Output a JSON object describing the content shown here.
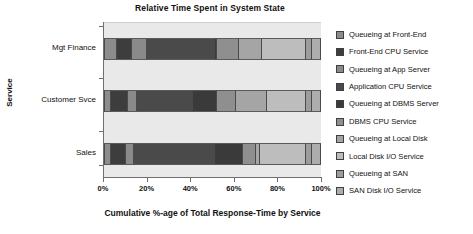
{
  "chart_data": {
    "type": "bar",
    "orientation": "horizontal",
    "stacked": true,
    "normalized": true,
    "title": "Relative Time Spent in System State",
    "xlabel": "Cumulative %-age of Total Response-Time by Service",
    "ylabel": "Service",
    "categories": [
      "Mgt Finance",
      "Customer Svce",
      "Sales"
    ],
    "category_order_top_to_bottom": [
      "Mgt Finance",
      "Customer Svce",
      "Sales"
    ],
    "xlim": [
      0,
      100
    ],
    "xticks": [
      0,
      20,
      40,
      60,
      80,
      100
    ],
    "xtick_labels": [
      "0%",
      "20%",
      "40%",
      "60%",
      "80%",
      "100%"
    ],
    "grid": false,
    "legend_position": "right",
    "series": [
      {
        "name": "Queueing at Front-End",
        "color": "#8c8c8c",
        "values": [
          6,
          3,
          3
        ]
      },
      {
        "name": "Front-End CPU Service",
        "color": "#3d3d3d",
        "values": [
          7,
          8,
          7
        ]
      },
      {
        "name": "Queueing at App Server",
        "color": "#8a8a8a",
        "values": [
          7,
          4,
          4
        ]
      },
      {
        "name": "Application CPU Service",
        "color": "#4a4a4a",
        "values": [
          31,
          26,
          37
        ]
      },
      {
        "name": "Queueing at DBMS Server",
        "color": "#3a3a3a",
        "values": [
          1,
          11,
          13
        ]
      },
      {
        "name": "DBMS CPU Service",
        "color": "#8f8f8f",
        "values": [
          10,
          9,
          6
        ]
      },
      {
        "name": "Queueing at Local Disk",
        "color": "#a5a5a5",
        "values": [
          11,
          14,
          2
        ]
      },
      {
        "name": "Local Disk I/O Service",
        "color": "#bdbdbd",
        "values": [
          20,
          18,
          21
        ]
      },
      {
        "name": "Queueing at SAN",
        "color": "#9c9c9c",
        "values": [
          3,
          3,
          3
        ]
      },
      {
        "name": "SAN Disk I/O Service",
        "color": "#adadad",
        "values": [
          4,
          4,
          4
        ]
      }
    ],
    "colors": {
      "plot_background": "#e9e9e9",
      "figure_background": "#ffffff",
      "axis": "#6f6f6f",
      "text": "#111111"
    }
  },
  "legend": {
    "items": [
      {
        "label": "Queueing at Front-End",
        "color": "#8c8c8c"
      },
      {
        "label": "Front-End CPU Service",
        "color": "#3d3d3d"
      },
      {
        "label": "Queueing at App Server",
        "color": "#8a8a8a"
      },
      {
        "label": "Application CPU Service",
        "color": "#4a4a4a"
      },
      {
        "label": "Queueing at DBMS Server",
        "color": "#3a3a3a"
      },
      {
        "label": "DBMS CPU Service",
        "color": "#8f8f8f"
      },
      {
        "label": "Queueing at Local Disk",
        "color": "#a5a5a5"
      },
      {
        "label": "Local Disk I/O Service",
        "color": "#bdbdbd"
      },
      {
        "label": "Queueing at SAN",
        "color": "#9c9c9c"
      },
      {
        "label": "SAN Disk I/O Service",
        "color": "#adadad"
      }
    ]
  }
}
